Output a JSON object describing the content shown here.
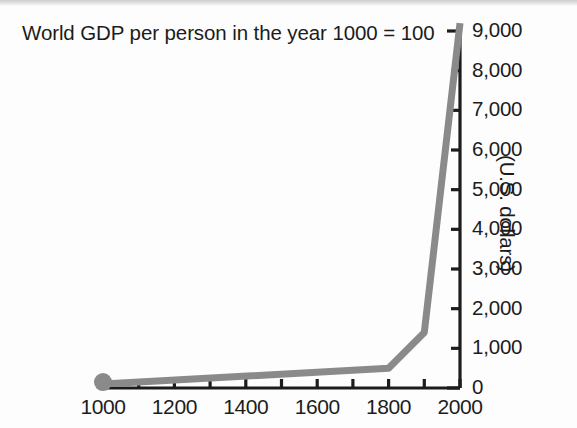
{
  "figure": {
    "title": "World GDP per person in the year 1000 = 100",
    "y_axis_label": "(U.S. dollars)"
  },
  "chart_data": {
    "type": "line",
    "title": "World GDP per person in the year 1000 = 100",
    "xlabel": "",
    "ylabel": "(U.S. dollars)",
    "xlim": [
      1000,
      2000
    ],
    "ylim": [
      0,
      9000
    ],
    "x_major_ticks": [
      1000,
      1200,
      1400,
      1600,
      1800,
      2000
    ],
    "x_minor_ticks": [
      1100,
      1300,
      1500,
      1700,
      1900
    ],
    "x_tick_labels": [
      "1000",
      "1200",
      "1400",
      "1600",
      "1800",
      "2000"
    ],
    "y_ticks": [
      0,
      1000,
      2000,
      3000,
      4000,
      5000,
      6000,
      7000,
      8000,
      9000
    ],
    "y_tick_labels": [
      "0",
      "1,000",
      "2,000",
      "3,000",
      "4,000",
      "5,000",
      "6,000",
      "7,000",
      "8,000",
      "9,000"
    ],
    "grid": false,
    "legend": false,
    "axis_position": {
      "y_axis": "right",
      "x_axis": "bottom"
    },
    "line_color": "#8a8a8a",
    "axis_color": "#1c1c1c",
    "marker": {
      "x": 1000,
      "y": 100,
      "shape": "circle",
      "color": "#8a8a8a"
    },
    "series": [
      {
        "name": "World GDP per person",
        "x": [
          1000,
          1800,
          1900,
          2000
        ],
        "values": [
          100,
          500,
          1400,
          9200
        ]
      }
    ]
  }
}
